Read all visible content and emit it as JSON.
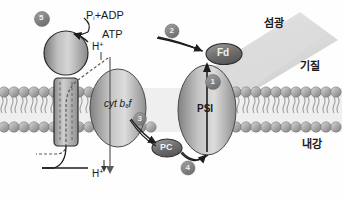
{
  "figure": {
    "palette": {
      "background": "#fefefe",
      "membrane_head": "#9a9a9a",
      "membrane_head_light": "#c9c9c9",
      "protein_fill": "#8e8e8e",
      "protein_light": "#d2d2d2",
      "badge_fill": "#8b8b8b",
      "badge_text": "#f2f2f2",
      "stroke": "#2b2b2b",
      "light_beam": "#cfcfcf",
      "text": "#1a1a1a"
    }
  },
  "regions": {
    "stroma_label": "기질",
    "lumen_label": "내강",
    "light_label": "섬광"
  },
  "complexes": {
    "atp_synthase": {
      "name": "ATP synthase",
      "substrate_label": "P",
      "substrate_sub": "i",
      "substrate_rest": "+ADP",
      "product_label": "ATP"
    },
    "cytochrome": {
      "prefix": "cyt b",
      "subscript": "6",
      "suffix": "f"
    },
    "photosystem_one": {
      "label": "PSI"
    },
    "ferredoxin": {
      "label": "Fd"
    },
    "plastocyanin": {
      "label": "PC"
    }
  },
  "protons": {
    "top": "H",
    "top_sup": "+",
    "bottom": "H",
    "bottom_sup": "+"
  },
  "steps": [
    {
      "id": "step-1",
      "label": "1",
      "x": 213,
      "y": 82
    },
    {
      "id": "step-2",
      "label": "2",
      "x": 172,
      "y": 31
    },
    {
      "id": "step-3",
      "label": "3",
      "x": 140,
      "y": 119
    },
    {
      "id": "step-4",
      "label": "4",
      "x": 188,
      "y": 168
    },
    {
      "id": "step-5",
      "label": "5",
      "x": 42,
      "y": 19
    }
  ]
}
